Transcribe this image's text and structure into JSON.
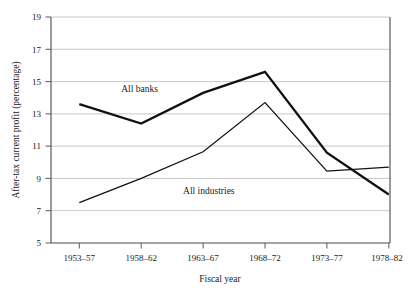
{
  "chart_data": {
    "type": "line",
    "title": "",
    "xlabel": "Fiscal year",
    "ylabel": "After-tax current profit (percentage)",
    "categories": [
      "1953–57",
      "1958–62",
      "1963–67",
      "1968–72",
      "1973–77",
      "1978–82"
    ],
    "yticks": [
      5,
      7,
      9,
      11,
      13,
      15,
      17,
      19
    ],
    "ytick_labels": [
      "5",
      "7",
      "9",
      "11",
      "13",
      "15",
      "17",
      "19"
    ],
    "ylim": [
      5,
      19
    ],
    "grid": "horizontal",
    "legend_position": "inline-annotations",
    "series": [
      {
        "name": "All banks",
        "values": [
          13.6,
          12.4,
          14.3,
          15.6,
          10.6,
          8.0
        ],
        "color": "#111111",
        "line_width": "thick",
        "annotation": "All banks"
      },
      {
        "name": "All industries",
        "values": [
          7.5,
          9.0,
          10.65,
          13.7,
          9.45,
          9.7
        ],
        "color": "#111111",
        "line_width": "thin",
        "annotation": "All industries"
      }
    ],
    "annotations": [
      {
        "text": "All banks",
        "x_category": "1958–62",
        "y_value": 14.55
      },
      {
        "text": "All industries",
        "x_category": "1963–67",
        "y_value": 8.2
      }
    ]
  },
  "axis": {
    "y_title": "After-tax current profit (percentage)",
    "x_title": "Fiscal year",
    "y_tick_0": "19",
    "y_tick_1": "17",
    "y_tick_2": "15",
    "y_tick_3": "13",
    "y_tick_4": "11",
    "y_tick_5": "9",
    "y_tick_6": "7",
    "y_tick_7": "5",
    "x_tick_0": "1953–57",
    "x_tick_1": "1958–62",
    "x_tick_2": "1963–67",
    "x_tick_3": "1968–72",
    "x_tick_4": "1973–77",
    "x_tick_5": "1978–82"
  },
  "labels": {
    "banks": "All banks",
    "industries": "All industries"
  },
  "colors": {
    "line": "#111111",
    "grid": "#b9b9b9",
    "spine": "#4a4a4a",
    "background": "#ffffff"
  }
}
